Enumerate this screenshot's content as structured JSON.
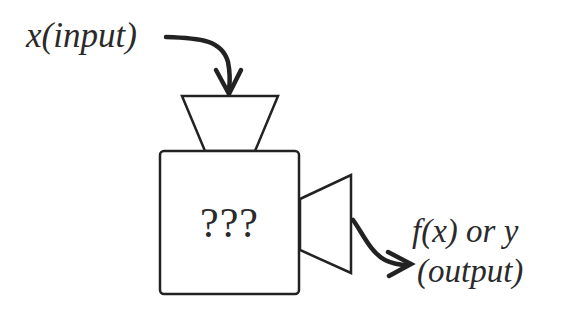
{
  "diagram": {
    "input_label": "x(input)",
    "center_label": "???",
    "output_label_line1": "f(x) or y",
    "output_label_line2": "(output)",
    "stroke_color": "#222222",
    "background_color": "#ffffff",
    "nodes": [
      {
        "id": "input",
        "shape": "text",
        "label": "x(input)"
      },
      {
        "id": "hopper",
        "shape": "inverted-trapezoid",
        "label": ""
      },
      {
        "id": "box",
        "shape": "rounded-square",
        "label": "???"
      },
      {
        "id": "nozzle",
        "shape": "trapezoid-horizontal",
        "label": ""
      },
      {
        "id": "output",
        "shape": "text",
        "label": "f(x) or y (output)"
      }
    ],
    "edges": [
      {
        "from": "input",
        "to": "hopper",
        "type": "curved-arrow"
      },
      {
        "from": "nozzle",
        "to": "output",
        "type": "curved-arrow"
      }
    ]
  }
}
